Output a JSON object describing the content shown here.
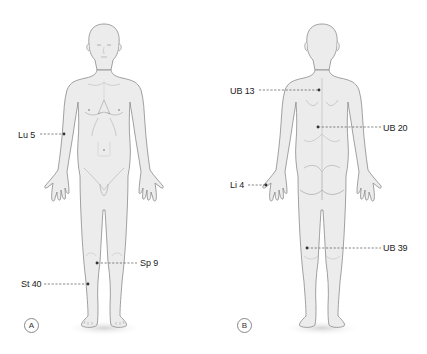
{
  "figure": {
    "panels": [
      {
        "id": "A",
        "view": "anterior",
        "badge": "A",
        "points": [
          {
            "label": "Lu 5",
            "side": "left"
          },
          {
            "label": "Sp 9",
            "side": "right"
          },
          {
            "label": "St 40",
            "side": "left"
          }
        ]
      },
      {
        "id": "B",
        "view": "posterior",
        "badge": "B",
        "points": [
          {
            "label": "UB 13",
            "side": "left"
          },
          {
            "label": "UB 20",
            "side": "right"
          },
          {
            "label": "Li 4",
            "side": "left"
          },
          {
            "label": "UB 39",
            "side": "right"
          }
        ]
      }
    ]
  },
  "colors": {
    "body_fill": "#ececec",
    "body_stroke": "#8a8a8a",
    "detail_stroke": "#b8b8b8",
    "leader": "#555555",
    "text": "#222222",
    "shadow": "#d9d9d9"
  }
}
